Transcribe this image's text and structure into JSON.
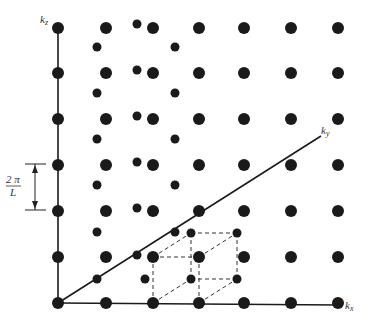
{
  "figure": {
    "ink_color": "#1a1a1a",
    "background": "#ffffff"
  },
  "axes": {
    "kz": {
      "label": "k",
      "subscript": "z",
      "from": [
        58,
        303
      ],
      "to": [
        58,
        27
      ],
      "label_pos": [
        40,
        23
      ]
    },
    "kx": {
      "label": "k",
      "subscript": "x",
      "from": [
        58,
        303
      ],
      "to": [
        340,
        305
      ],
      "label_pos": [
        345,
        309
      ]
    },
    "ky": {
      "label": "k",
      "subscript": "y",
      "from": [
        58,
        303
      ],
      "to": [
        321,
        136
      ],
      "label_pos": [
        321,
        134
      ]
    }
  },
  "spacing_annotation": {
    "numerator": "2 π",
    "denominator": "L",
    "top_y": 164,
    "bottom_y": 210,
    "x": 35
  },
  "lattice": {
    "front_columns_x": [
      58,
      106,
      153,
      199,
      244,
      291,
      338
    ],
    "front_rows_y": [
      28,
      73,
      119,
      165,
      211,
      257,
      303
    ],
    "front_dot_radius": 6,
    "back_dot_radius": 4.5,
    "back_dots": [
      [
        97,
        47
      ],
      [
        97,
        93
      ],
      [
        97,
        139
      ],
      [
        97,
        185
      ],
      [
        97,
        232
      ],
      [
        97,
        279
      ],
      [
        137,
        24
      ],
      [
        137,
        70
      ],
      [
        137,
        116
      ],
      [
        137,
        162
      ],
      [
        137,
        208
      ],
      [
        137,
        255
      ],
      [
        175,
        47
      ],
      [
        175,
        93
      ],
      [
        175,
        139
      ],
      [
        175,
        185
      ],
      [
        175,
        232
      ],
      [
        145,
        279
      ],
      [
        191,
        233
      ],
      [
        237,
        233
      ],
      [
        191,
        279
      ],
      [
        237,
        279
      ]
    ]
  },
  "unit_cell": {
    "front": [
      [
        153,
        257
      ],
      [
        199,
        257
      ],
      [
        199,
        303
      ],
      [
        153,
        303
      ]
    ],
    "back": [
      [
        191,
        233
      ],
      [
        237,
        233
      ],
      [
        237,
        279
      ],
      [
        191,
        279
      ]
    ]
  }
}
